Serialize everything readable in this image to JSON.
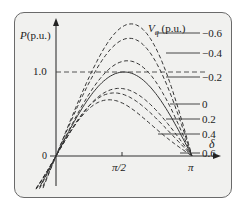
{
  "chart_data": {
    "type": "line",
    "title": "",
    "xlabel": "δ",
    "ylabel": "P(p.u.)",
    "legend_title": "V_q (p.u.)",
    "x_ticks": [
      "0",
      "π/2",
      "π"
    ],
    "y_ticks": [
      "1.0"
    ],
    "xlim": [
      0,
      3.1416
    ],
    "reference_line": {
      "y": 1.0,
      "style": "dashed"
    },
    "grid": false,
    "legend_position": "right, leader lines",
    "series": [
      {
        "name": "-0.6",
        "style": "dashed",
        "peak": 1.55
      },
      {
        "name": "-0.4",
        "style": "dashed",
        "peak": 1.39
      },
      {
        "name": "-0.2",
        "style": "dashed",
        "peak": 1.13
      },
      {
        "name": "0",
        "style": "solid",
        "peak": 1.0
      },
      {
        "name": "0.2",
        "style": "dashed",
        "peak": 0.8
      },
      {
        "name": "0.4",
        "style": "dashed",
        "peak": 0.73
      },
      {
        "name": "0.6",
        "style": "dashed",
        "peak": 0.62
      }
    ]
  },
  "labels": {
    "y_axis": "P(p.u.)",
    "x_axis": "δ",
    "legend_title_v": "V",
    "legend_title_sub": "q",
    "legend_title_unit": " (p.u.)",
    "tick_one": "1.0",
    "tick_origin": "0",
    "tick_half_pi": "π/2",
    "tick_pi": "π",
    "series_labels": [
      "−0.6",
      "−0.4",
      "−0.2",
      "0",
      "0.2",
      "0.4",
      "0.6"
    ]
  }
}
